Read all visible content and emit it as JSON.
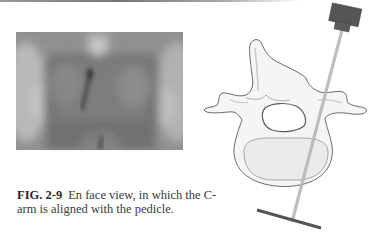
{
  "figure": {
    "label": "FIG. 2-9",
    "caption": "En face view, in which the C-arm is aligned with the pedicle.",
    "xray_image": "fluoroscopic-spine-en-face-view",
    "diagram": {
      "subject": "vertebra-axial-view",
      "beam": "c-arm-x-ray-beam-through-pedicle",
      "colors": {
        "emitter": "#555555",
        "receiver_plate": "#5a5a5a",
        "beam": "#bdbdbd",
        "bone_outline": "#6a6a6a",
        "bone_fill": "#f4f4f4"
      }
    }
  }
}
